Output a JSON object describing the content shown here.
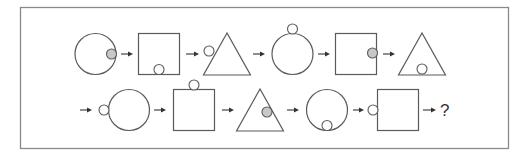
{
  "puzzle": {
    "title": "Shape sequence puzzle",
    "colors": {
      "frame": "#8a8a8a",
      "outline": "#5a5a5a",
      "filled_dot": "#c8c8c8",
      "empty_dot": "#ffffff",
      "arrow": "#333333"
    },
    "rows": [
      {
        "items": [
          {
            "shape": "circle",
            "dot_position": "right-edge-inside",
            "dot_fill": "filled"
          },
          {
            "shape": "square",
            "dot_position": "bottom-edge-inside",
            "dot_fill": "empty"
          },
          {
            "shape": "triangle",
            "dot_position": "left-edge-outside",
            "dot_fill": "empty"
          },
          {
            "shape": "circle",
            "dot_position": "top-outside",
            "dot_fill": "empty"
          },
          {
            "shape": "square",
            "dot_position": "right-edge-inside",
            "dot_fill": "filled"
          },
          {
            "shape": "triangle",
            "dot_position": "bottom-edge-inside",
            "dot_fill": "empty"
          }
        ],
        "trailing_arrow": true
      },
      {
        "leading_arrow": true,
        "items": [
          {
            "shape": "circle",
            "dot_position": "left-outside",
            "dot_fill": "empty"
          },
          {
            "shape": "square",
            "dot_position": "top-outside",
            "dot_fill": "empty"
          },
          {
            "shape": "triangle",
            "dot_position": "right-edge-inside",
            "dot_fill": "filled"
          },
          {
            "shape": "circle",
            "dot_position": "bottom-edge-inside",
            "dot_fill": "empty"
          },
          {
            "shape": "square",
            "dot_position": "left-outside",
            "dot_fill": "empty"
          }
        ],
        "answer_label": "?"
      }
    ]
  }
}
